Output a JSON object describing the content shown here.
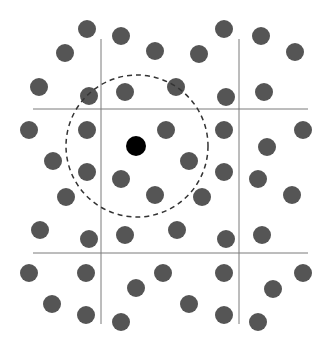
{
  "diagram": {
    "width": 330,
    "height": 350,
    "colors": {
      "background": "#ffffff",
      "grid_line": "#7a7a7a",
      "dot": "#555555",
      "focus_dot": "#000000",
      "circle": "#333333"
    },
    "grid_lines": {
      "vertical": [
        {
          "x": 101,
          "y1": 39,
          "y2": 324
        },
        {
          "x": 239,
          "y1": 39,
          "y2": 324
        }
      ],
      "horizontal": [
        {
          "y": 109,
          "x1": 33,
          "x2": 308
        },
        {
          "y": 253,
          "x1": 33,
          "x2": 308
        }
      ]
    },
    "dot_radius": 9,
    "dots": [
      [
        87,
        29
      ],
      [
        121,
        36
      ],
      [
        65,
        53
      ],
      [
        155,
        51
      ],
      [
        39,
        87
      ],
      [
        89,
        96
      ],
      [
        125,
        92
      ],
      [
        224,
        29
      ],
      [
        261,
        36
      ],
      [
        199,
        54
      ],
      [
        295,
        52
      ],
      [
        176,
        87
      ],
      [
        226,
        97
      ],
      [
        264,
        92
      ],
      [
        29,
        130
      ],
      [
        87,
        130
      ],
      [
        53,
        161
      ],
      [
        87,
        172
      ],
      [
        66,
        197
      ],
      [
        121,
        179
      ],
      [
        155,
        195
      ],
      [
        166,
        130
      ],
      [
        189,
        161
      ],
      [
        202,
        197
      ],
      [
        224,
        130
      ],
      [
        303,
        130
      ],
      [
        267,
        147
      ],
      [
        224,
        172
      ],
      [
        258,
        179
      ],
      [
        292,
        195
      ],
      [
        40,
        230
      ],
      [
        89,
        239
      ],
      [
        125,
        235
      ],
      [
        177,
        230
      ],
      [
        226,
        239
      ],
      [
        262,
        235
      ],
      [
        29,
        273
      ],
      [
        86,
        273
      ],
      [
        136,
        288
      ],
      [
        52,
        304
      ],
      [
        86,
        315
      ],
      [
        121,
        322
      ],
      [
        163,
        273
      ],
      [
        224,
        273
      ],
      [
        303,
        273
      ],
      [
        273,
        289
      ],
      [
        189,
        304
      ],
      [
        224,
        315
      ],
      [
        258,
        322
      ]
    ],
    "focus_dot": {
      "x": 136,
      "y": 146,
      "r": 10
    },
    "neighborhood_circle": {
      "cx": 137,
      "cy": 146,
      "r": 71,
      "dash": "5,4"
    }
  }
}
